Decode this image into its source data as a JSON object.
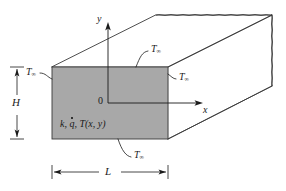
{
  "figure": {
    "background_color": "#ffffff",
    "line_color": "#3a3a3a",
    "face_fill_color": "#a8a8a8",
    "text_color": "#1a1a1a"
  },
  "axes": {
    "y_label": "y",
    "x_label": "x",
    "origin_label": "0"
  },
  "dimensions": {
    "height_label": "H",
    "length_label": "L"
  },
  "material": {
    "symbol_k": "k",
    "symbol_qdot": "q",
    "symbol_temperature_field": "T(x, y)",
    "full_label": "k, q, T(x, y)"
  },
  "boundary_labels": {
    "symbol": "T",
    "subscript": "∞",
    "left": "T",
    "top": "T",
    "right": "T",
    "bottom": "T"
  }
}
